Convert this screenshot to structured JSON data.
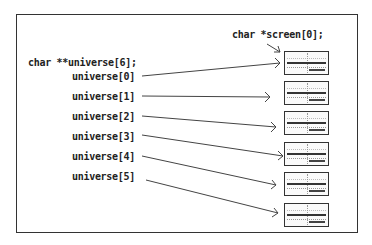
{
  "labels": {
    "screen_decl": "char *screen[0];",
    "universe_decl": "char **universe[6];",
    "universe_items": [
      "universe[0]",
      "universe[1]",
      "universe[2]",
      "universe[3]",
      "universe[4]",
      "universe[5]"
    ]
  },
  "thumbnails": 6
}
